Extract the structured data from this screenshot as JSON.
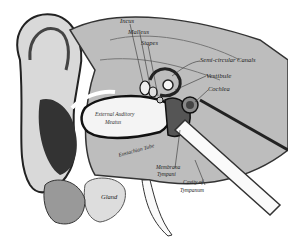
{
  "figure": {
    "labels": {
      "incus": "Incus",
      "malleus": "Malleus",
      "stapes": "Stapes",
      "semicircular_canals": "Semi-circular Canals",
      "vestibule": "Vestibule",
      "cochlea": "Cochlea",
      "meatus_line1": "External Auditory",
      "meatus_line2": "Meatus",
      "eustachian": "Eustachian Tube",
      "membrana_line1": "Membrana",
      "membrana_line2": "Tympani",
      "cavity_line1": "Cavity of",
      "cavity_line2": "Tympanum",
      "gland": "Gland"
    }
  }
}
